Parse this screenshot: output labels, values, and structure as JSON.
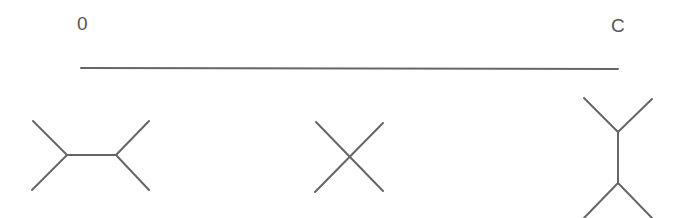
{
  "axis": {
    "start_label": "0",
    "end_label": "C"
  },
  "diagram": {
    "stroke_color": "#666666",
    "trees": [
      {
        "name": "horizontal-split-tree",
        "position": "left"
      },
      {
        "name": "star-tree",
        "position": "center"
      },
      {
        "name": "vertical-split-tree",
        "position": "right"
      }
    ]
  }
}
